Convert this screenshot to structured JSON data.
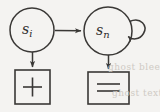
{
  "figure": {
    "type": "directed-graph-diagram",
    "background_color": "#f4f3f1",
    "ink_color": "#3a3836",
    "nodes": [
      {
        "id": "s-i",
        "shape": "circle",
        "label_base": "s",
        "label_subscript": "i",
        "cx": 32,
        "cy": 30,
        "r": 22
      },
      {
        "id": "s-n",
        "shape": "circle",
        "label_base": "s",
        "label_subscript": "n",
        "cx": 108,
        "cy": 31,
        "r": 24
      }
    ],
    "boxes": [
      {
        "id": "plus-box",
        "shape": "rectangle",
        "symbol": "+",
        "x": 15,
        "y": 70,
        "width": 35,
        "height": 34
      },
      {
        "id": "equals-box",
        "shape": "rectangle",
        "symbol": "=",
        "x": 88,
        "y": 72,
        "width": 41,
        "height": 32
      }
    ],
    "edges": [
      {
        "id": "edge-si-to-sn",
        "from": "s-i",
        "to": "s-n",
        "style": "straight",
        "direction": "right",
        "arrowhead": true
      },
      {
        "id": "edge-si-to-plus",
        "from": "s-i",
        "to": "plus-box",
        "style": "straight",
        "direction": "down",
        "arrowhead": true
      },
      {
        "id": "edge-sn-to-equals",
        "from": "s-n",
        "to": "equals-box",
        "style": "straight",
        "direction": "down",
        "arrowhead": true
      },
      {
        "id": "edge-sn-self-loop",
        "from": "s-n",
        "to": "s-n",
        "style": "self-loop",
        "direction": "right",
        "arrowhead": true
      }
    ],
    "ghost_artifacts": {
      "upper_text": "ghost bleed",
      "lower_text": "ghost text"
    }
  }
}
